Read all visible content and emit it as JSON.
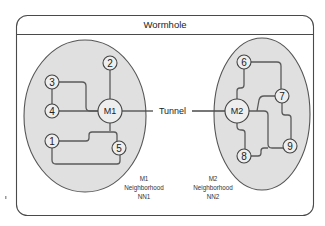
{
  "title": "Wormhole",
  "tunnel_label": "Tunnel",
  "neighborhoods": [
    {
      "id": "NN1",
      "hub": "M1",
      "caption": [
        "M1",
        "Neighborhood",
        "NN1"
      ],
      "nodes": [
        "1",
        "2",
        "3",
        "4",
        "5"
      ]
    },
    {
      "id": "NN2",
      "hub": "M2",
      "caption": [
        "M2",
        "Neighborhood",
        "NN2"
      ],
      "nodes": [
        "6",
        "7",
        "8",
        "9"
      ]
    }
  ],
  "nodes": {
    "M1": "M1",
    "M2": "M2",
    "n1": "1",
    "n2": "2",
    "n3": "3",
    "n4": "4",
    "n5": "5",
    "n6": "6",
    "n7": "7",
    "n8": "8",
    "n9": "9"
  },
  "links": [
    [
      "M1",
      "2"
    ],
    [
      "M1",
      "3"
    ],
    [
      "M1",
      "4"
    ],
    [
      "M1",
      "1"
    ],
    [
      "M1",
      "5"
    ],
    [
      "1",
      "5"
    ],
    [
      "M2",
      "6"
    ],
    [
      "6",
      "7"
    ],
    [
      "M2",
      "7"
    ],
    [
      "M2",
      "9"
    ],
    [
      "7",
      "9"
    ],
    [
      "M2",
      "8"
    ],
    [
      "8",
      "9"
    ],
    [
      "M1",
      "M2"
    ]
  ],
  "colors": {
    "neighborhood_fill": "#e0e0e0",
    "node_fill": "#eeeeee",
    "line": "#5a5a5a"
  }
}
